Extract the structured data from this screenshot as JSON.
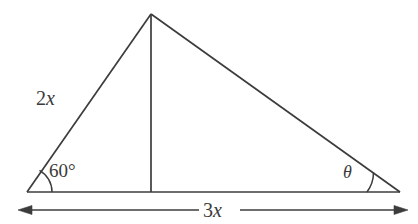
{
  "figure": {
    "kind": "geometry-diagram",
    "background_color": "#ffffff",
    "line_color": "#3c3c3c"
  },
  "labels": {
    "side_left": {
      "coefficient": "2",
      "variable": "x",
      "text": "2x"
    },
    "angle_left": {
      "text": "60°",
      "value": "60",
      "unit": "degrees"
    },
    "angle_right": {
      "text": "θ",
      "name": "theta"
    },
    "base": {
      "coefficient": "3",
      "variable": "x",
      "text": "3x"
    }
  },
  "geometry": {
    "vertices": {
      "left": {
        "x": 27,
        "y": 192
      },
      "right": {
        "x": 400,
        "y": 192
      },
      "apex": {
        "x": 151,
        "y": 14
      },
      "altitude_foot": {
        "x": 151,
        "y": 192
      }
    },
    "dimension_arrow": {
      "y": 210,
      "x_start": 18,
      "x_end": 408,
      "both_ends": "arrowheads"
    },
    "arcs": {
      "left_angle_radius": 25,
      "right_angle_radius": 33
    }
  }
}
